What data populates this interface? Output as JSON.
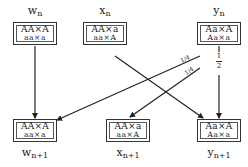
{
  "diagram": {
    "nodes": [
      {
        "id": "w_n",
        "var": "w",
        "sub": "n",
        "row1": "AA×A",
        "row2": "aa×a"
      },
      {
        "id": "x_n",
        "var": "x",
        "sub": "n",
        "row1": "AA×a",
        "row2": "aa×A"
      },
      {
        "id": "y_n",
        "var": "y",
        "sub": "n",
        "row1": "Aa×A",
        "row2": "Aa×a"
      },
      {
        "id": "w_n1",
        "var": "w",
        "sub": "n+1",
        "row1": "AA×A",
        "row2": "aa×a"
      },
      {
        "id": "x_n1",
        "var": "x",
        "sub": "n+1",
        "row1": "AA×a",
        "row2": "aa×A"
      },
      {
        "id": "y_n1",
        "var": "y",
        "sub": "n+1",
        "row1": "Aa×A",
        "row2": "Aa×a"
      }
    ],
    "edges": [
      {
        "from": "w_n",
        "to": "w_n1",
        "label": ""
      },
      {
        "from": "x_n",
        "to": "y_n1",
        "label": ""
      },
      {
        "from": "y_n",
        "to": "w_n1",
        "label": "1/4"
      },
      {
        "from": "y_n",
        "to": "x_n1",
        "label": "1/4"
      },
      {
        "from": "y_n",
        "to": "y_n1",
        "label": "1/2"
      }
    ],
    "fractions": {
      "quarter_num": "1",
      "quarter_den": "4",
      "half_num": "1",
      "half_den": "2"
    }
  }
}
